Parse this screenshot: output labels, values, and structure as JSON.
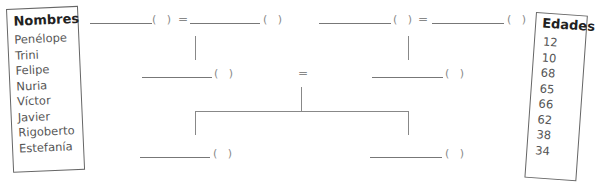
{
  "names_box": {
    "title": "Nombres",
    "items": [
      "Penélope",
      "Trini",
      "Felipe",
      "Nuria",
      "Víctor",
      "Javier",
      "Rigoberto",
      "Estefanía"
    ]
  },
  "ages_box": {
    "title": "Edades",
    "items": [
      "12",
      "10",
      "68",
      "65",
      "66",
      "62",
      "38",
      "34"
    ]
  },
  "tree": {
    "blank_paren": "(   )",
    "equals": "="
  }
}
